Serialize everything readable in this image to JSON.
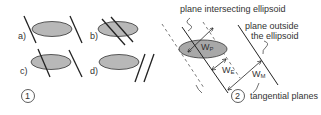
{
  "panel1": {
    "number": "1",
    "cases": [
      {
        "label": "a)",
        "description": "plane tangent outside on both sides"
      },
      {
        "label": "b)",
        "description": "two planes intersecting ellipsoid"
      },
      {
        "label": "c)",
        "description": "one plane intersecting, one outside"
      },
      {
        "label": "d)",
        "description": "both planes outside ellipsoid"
      }
    ]
  },
  "panel2": {
    "number": "2",
    "annotations": {
      "intersecting": "plane intersecting ellipsoid",
      "outside_line1": "plane outside",
      "outside_line2": "the ellipsoid",
      "tangential": "tangential planes"
    },
    "widths": {
      "wp": {
        "base": "W",
        "sub": "P"
      },
      "we": {
        "base": "W",
        "sub": "E"
      },
      "wm": {
        "base": "W",
        "sub": "M"
      }
    }
  },
  "colors": {
    "ellipse_fill": "#b8b8b8",
    "line": "#222222",
    "text": "#333333"
  }
}
